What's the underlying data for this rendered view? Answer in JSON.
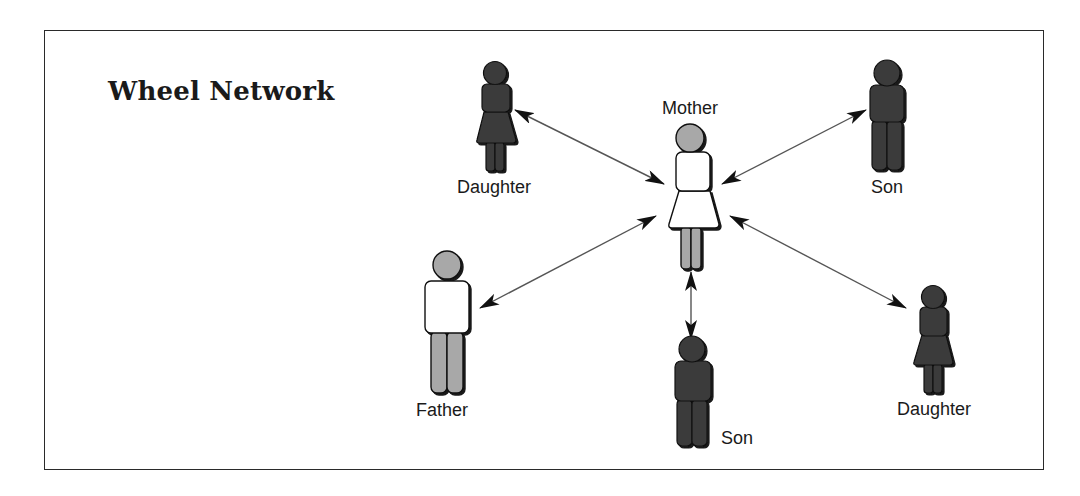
{
  "title": "Wheel Network",
  "colors": {
    "dark_fill": "#3b3b3b",
    "gray_fill": "#a8a8a8",
    "light_fill": "#ffffff",
    "outline": "#111111",
    "arrow": "#555555"
  },
  "nodes": [
    {
      "id": "daughter-1",
      "label": "Daughter",
      "kind": "female",
      "tone": "dark"
    },
    {
      "id": "mother",
      "label": "Mother",
      "kind": "female",
      "tone": "light"
    },
    {
      "id": "son-1",
      "label": "Son",
      "kind": "male",
      "tone": "dark"
    },
    {
      "id": "father",
      "label": "Father",
      "kind": "male",
      "tone": "light"
    },
    {
      "id": "son-2",
      "label": "Son",
      "kind": "male",
      "tone": "dark"
    },
    {
      "id": "daughter-2",
      "label": "Daughter",
      "kind": "female",
      "tone": "dark"
    }
  ],
  "edges": [
    {
      "from": "mother",
      "to": "daughter-1",
      "bidirectional": true
    },
    {
      "from": "mother",
      "to": "son-1",
      "bidirectional": true
    },
    {
      "from": "mother",
      "to": "father",
      "bidirectional": true
    },
    {
      "from": "mother",
      "to": "daughter-2",
      "bidirectional": true
    },
    {
      "from": "mother",
      "to": "son-2",
      "bidirectional": true
    }
  ]
}
